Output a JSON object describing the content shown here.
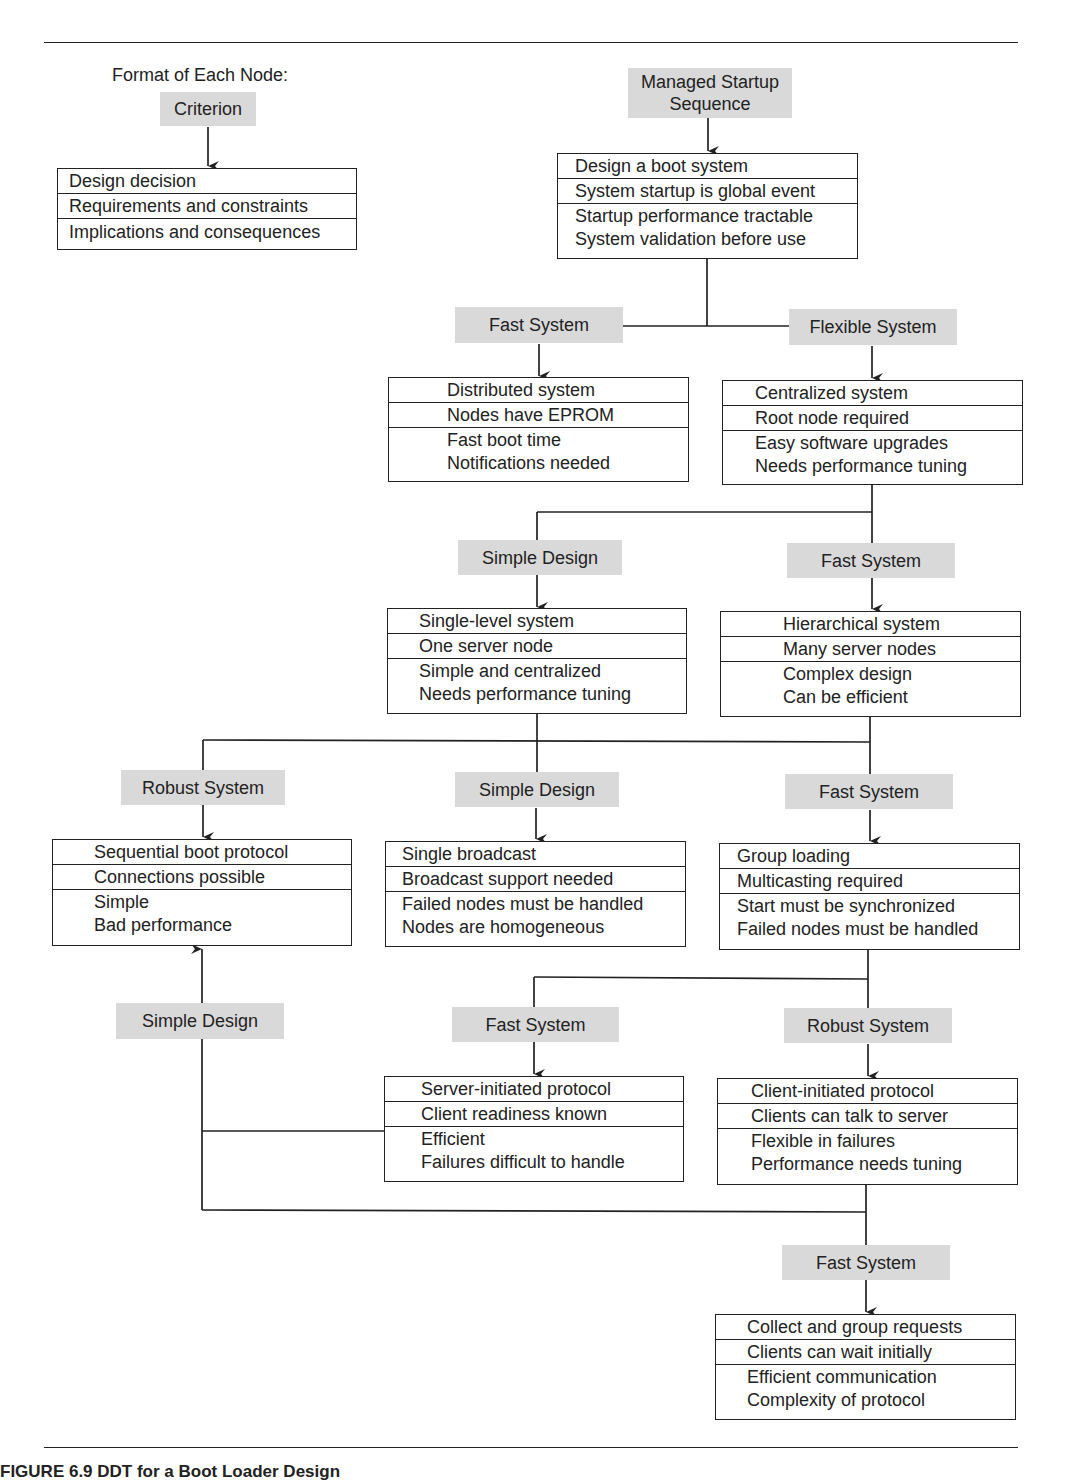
{
  "legend": {
    "title": "Format of Each Node:",
    "criterion": "Criterion",
    "rows": [
      "Design decision",
      "Requirements and constraints",
      "Implications and consequences"
    ]
  },
  "nodes": [
    {
      "id": "root",
      "criterion": "Managed Startup Sequence",
      "decision": "Design a boot system",
      "requirement": "System startup is global event",
      "implications": [
        "Startup performance tractable",
        "System validation before use"
      ]
    },
    {
      "id": "distributed",
      "criterion": "Fast System",
      "decision": "Distributed system",
      "requirement": "Nodes have EPROM",
      "implications": [
        "Fast boot time",
        "Notifications needed"
      ]
    },
    {
      "id": "centralized",
      "criterion": "Flexible System",
      "decision": "Centralized system",
      "requirement": "Root node required",
      "implications": [
        "Easy software upgrades",
        "Needs performance tuning"
      ]
    },
    {
      "id": "single-level",
      "criterion": "Simple Design",
      "decision": "Single-level system",
      "requirement": "One server node",
      "implications": [
        "Simple and centralized",
        "Needs performance tuning"
      ]
    },
    {
      "id": "hierarchical",
      "criterion": "Fast System",
      "decision": "Hierarchical system",
      "requirement": "Many server nodes",
      "implications": [
        "Complex design",
        "Can be efficient"
      ]
    },
    {
      "id": "sequential",
      "criterion": "Robust System",
      "decision": "Sequential boot protocol",
      "requirement": "Connections possible",
      "implications": [
        "Simple",
        "Bad performance"
      ]
    },
    {
      "id": "broadcast",
      "criterion": "Simple Design",
      "decision": "Single broadcast",
      "requirement": "Broadcast support needed",
      "implications": [
        "Failed nodes must be handled",
        "Nodes are homogeneous"
      ]
    },
    {
      "id": "group-loading",
      "criterion": "Fast System",
      "decision": "Group loading",
      "requirement": "Multicasting required",
      "implications": [
        "Start must be synchronized",
        "Failed nodes must be handled"
      ]
    },
    {
      "id": "server-initiated",
      "criterion": "Fast System",
      "decision": "Server-initiated protocol",
      "requirement": "Client readiness known",
      "implications": [
        "Efficient",
        "Failures difficult to handle"
      ]
    },
    {
      "id": "client-initiated",
      "criterion": "Robust System",
      "decision": "Client-initiated protocol",
      "requirement": "Clients can talk to server",
      "implications": [
        "Flexible in failures",
        "Performance needs tuning"
      ]
    },
    {
      "id": "collect-group",
      "criterion": "Fast System",
      "decision": "Collect and group requests",
      "requirement": "Clients can wait initially",
      "implications": [
        "Efficient communication",
        "Complexity of protocol"
      ]
    }
  ],
  "back_edge": {
    "criterion": "Simple Design",
    "from": [
      "server-initiated",
      "client-initiated"
    ],
    "to": "sequential"
  },
  "caption": "FIGURE 6.9   DDT for a Boot Loader Design",
  "colors": {
    "criterion_bg": "#d9d9d9",
    "line": "#222222",
    "background": "#ffffff"
  }
}
